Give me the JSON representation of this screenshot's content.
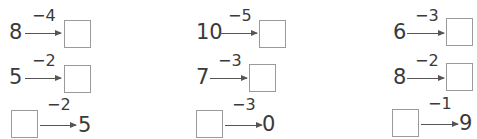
{
  "problems": [
    {
      "start": "8",
      "op": "−4",
      "end": ""
    },
    {
      "start": "10",
      "op": "−5",
      "end": ""
    },
    {
      "start": "6",
      "op": "−3",
      "end": ""
    },
    {
      "start": "5",
      "op": "−2",
      "end": ""
    },
    {
      "start": "7",
      "op": "−3",
      "end": ""
    },
    {
      "start": "8",
      "op": "−2",
      "end": ""
    },
    {
      "start": "",
      "op": "−2",
      "end": "5"
    },
    {
      "start": "",
      "op": "−3",
      "end": "0"
    },
    {
      "start": "",
      "op": "−1",
      "end": "9"
    }
  ]
}
